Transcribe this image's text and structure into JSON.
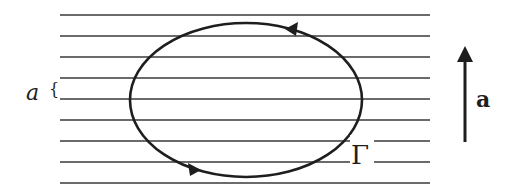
{
  "diagram": {
    "parallel_line_count": 9,
    "labels": {
      "spacing_label": "a",
      "spacing_brace": "{",
      "contour_label": "Γ",
      "vector_label": "a"
    },
    "contour_orientation": "counterclockwise",
    "vector_direction": "up",
    "colors": {
      "ink": "#1e1e1e",
      "background": "#ffffff"
    }
  }
}
